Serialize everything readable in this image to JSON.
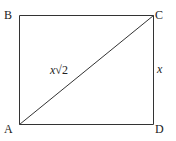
{
  "diagram": {
    "type": "rectangle-with-diagonal",
    "stroke_color": "#333333",
    "vertices": {
      "A": {
        "label": "A",
        "x": 19,
        "y": 124
      },
      "B": {
        "label": "B",
        "x": 19,
        "y": 15
      },
      "C": {
        "label": "C",
        "x": 153,
        "y": 15
      },
      "D": {
        "label": "D",
        "x": 153,
        "y": 124
      }
    },
    "edges": [
      {
        "from": "A",
        "to": "B"
      },
      {
        "from": "B",
        "to": "C"
      },
      {
        "from": "C",
        "to": "D"
      },
      {
        "from": "D",
        "to": "A"
      },
      {
        "from": "A",
        "to": "C",
        "kind": "diagonal"
      }
    ],
    "side_labels": {
      "diagonal_var": "x",
      "diagonal_radical": "√2",
      "side_CD": "x"
    }
  }
}
